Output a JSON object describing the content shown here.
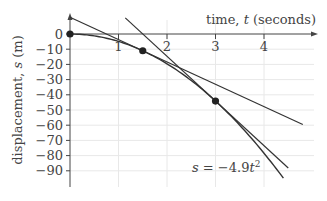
{
  "chart_data": {
    "type": "line",
    "title": "",
    "xlabel": "time, t (seconds)",
    "ylabel": "displacement, s (m)",
    "annotation": "s = −4.9t²",
    "x_ticks": [
      "1",
      "2",
      "3",
      "4"
    ],
    "y_ticks": [
      "0",
      "−10",
      "−20",
      "−30",
      "−40",
      "−50",
      "−60",
      "−70",
      "−80",
      "−90"
    ],
    "xlim": [
      0,
      4.9
    ],
    "ylim": [
      -100,
      10
    ],
    "grid": true,
    "series": [
      {
        "name": "s = -4.9t^2",
        "kind": "curve",
        "x": [
          0,
          0.5,
          1,
          1.5,
          2,
          2.5,
          3,
          3.5,
          4,
          4.5
        ],
        "values": [
          0,
          -1.225,
          -4.9,
          -11.025,
          -19.6,
          -30.625,
          -44.1,
          -60.025,
          -78.4,
          -99.225
        ]
      },
      {
        "name": "tangent at t=1.5",
        "kind": "line",
        "x": [
          0,
          4.8
        ],
        "values": [
          11.025,
          -59.535
        ]
      },
      {
        "name": "tangent at t=3",
        "kind": "line",
        "x": [
          1.14,
          4.5
        ],
        "values": [
          10.6,
          -88.2
        ]
      }
    ],
    "points": [
      {
        "x": 0,
        "y": 0
      },
      {
        "x": 1.5,
        "y": -11.025
      },
      {
        "x": 3,
        "y": -44.1
      }
    ]
  },
  "labels": {
    "xlabel": "time, ",
    "xvar": "t",
    "xunit": " (seconds)",
    "ylabel": "displacement, ",
    "yvar": "s",
    "yunit": " (m)",
    "eq_lhs": "s",
    "eq_rhs": " = −4.9",
    "eq_var": "t",
    "eq_exp": "2"
  }
}
